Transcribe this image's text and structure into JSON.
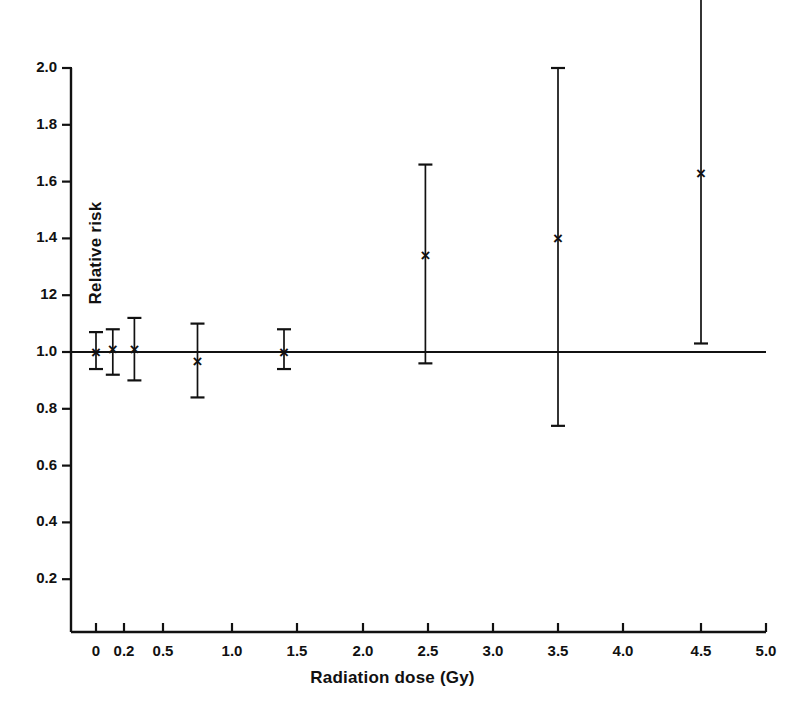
{
  "chart_data": {
    "type": "scatter",
    "title": "",
    "xlabel": "Radiation dose (Gy)",
    "ylabel": "Relative risk",
    "xlim": [
      0,
      5.0
    ],
    "ylim": [
      0,
      2.0
    ],
    "grid": false,
    "legend": null,
    "reference_line": {
      "y": 1.0,
      "orientation": "horizontal"
    },
    "x_ticks": [
      "0",
      "0.2",
      "0.5",
      "1.0",
      "1.5",
      "2.0",
      "2.5",
      "3.0",
      "3.5",
      "4.0",
      "4.5",
      "5.0"
    ],
    "x_tick_values": [
      0,
      0.2,
      0.5,
      1.0,
      1.5,
      2.0,
      2.5,
      3.0,
      3.5,
      4.0,
      4.5,
      5.0
    ],
    "y_ticks": [
      "0.2",
      "0.4",
      "0.6",
      "0.8",
      "1.0",
      "12",
      "1.4",
      "1.6",
      "1.8",
      "2.0"
    ],
    "y_tick_values": [
      0.2,
      0.4,
      0.6,
      0.8,
      1.0,
      1.2,
      1.4,
      1.6,
      1.8,
      2.0
    ],
    "marker": "x",
    "error_bars": "vertical",
    "points": [
      {
        "x": 0.0,
        "y": 1.0,
        "y_low": 0.94,
        "y_high": 1.07
      },
      {
        "x": 0.12,
        "y": 1.01,
        "y_low": 0.92,
        "y_high": 1.08
      },
      {
        "x": 0.28,
        "y": 1.01,
        "y_low": 0.9,
        "y_high": 1.12
      },
      {
        "x": 0.75,
        "y": 0.97,
        "y_low": 0.84,
        "y_high": 1.1
      },
      {
        "x": 1.4,
        "y": 1.0,
        "y_low": 0.94,
        "y_high": 1.08
      },
      {
        "x": 2.48,
        "y": 1.34,
        "y_low": 0.96,
        "y_high": 1.66
      },
      {
        "x": 3.5,
        "y": 1.4,
        "y_low": 0.74,
        "y_high": 2.0
      },
      {
        "x": 4.5,
        "y": 1.63,
        "y_low": 1.03,
        "y_high": 2.3
      }
    ]
  },
  "colors": {
    "ink": "#111111",
    "background": "#ffffff"
  }
}
